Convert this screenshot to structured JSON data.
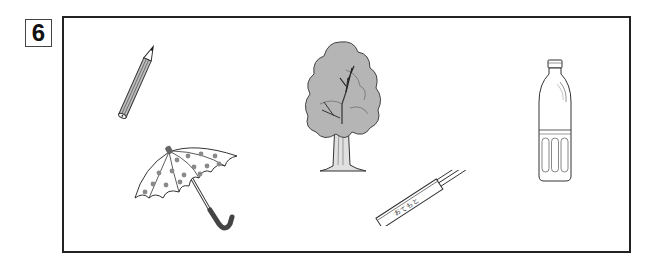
{
  "question_number": "6",
  "items": [
    {
      "id": "pencil",
      "label": "pencil"
    },
    {
      "id": "umbrella",
      "label": "umbrella"
    },
    {
      "id": "tree",
      "label": "tree"
    },
    {
      "id": "chopsticks",
      "label": "disposable chopsticks",
      "wrapper_text": "おてもと"
    },
    {
      "id": "bottle",
      "label": "plastic bottle"
    }
  ],
  "colors": {
    "line": "#333333",
    "fill_gray": "#b5b5b5",
    "dot_gray": "#8a8a8a",
    "handle_gray": "#666666",
    "frame": "#222222"
  }
}
